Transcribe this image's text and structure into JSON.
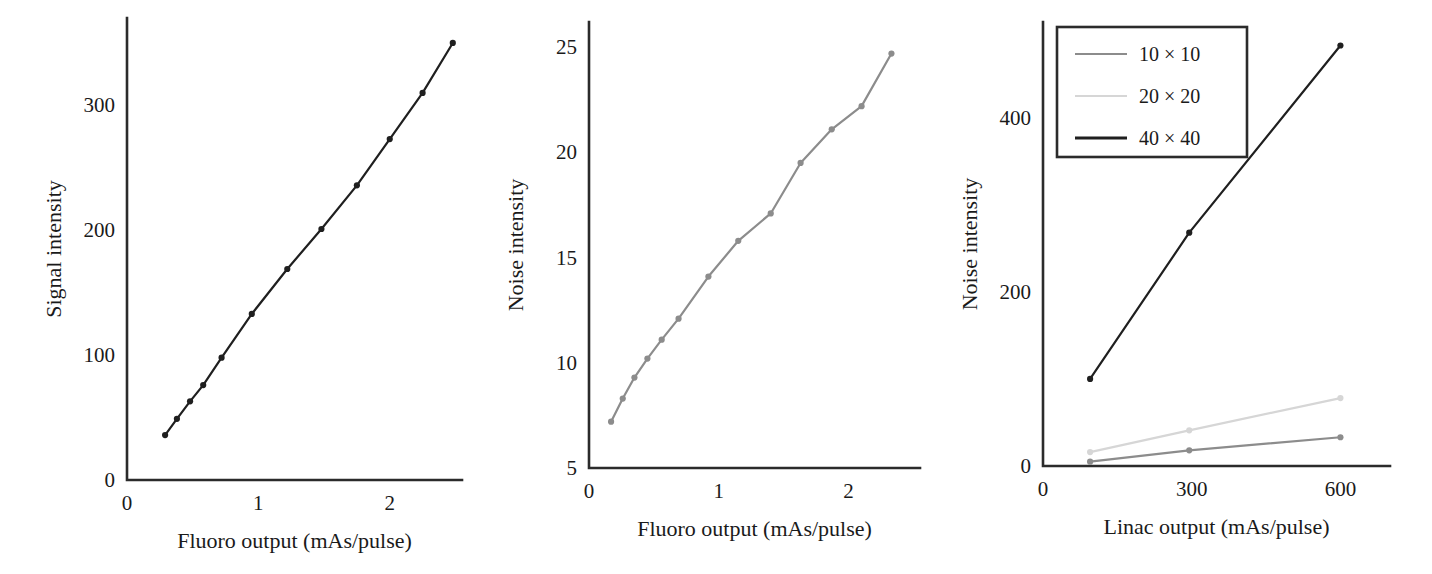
{
  "figure": {
    "background": "#ffffff",
    "axis_color": "#2b2b2b",
    "panel_count": 3
  },
  "colors": {
    "black": "#1f1f1f",
    "mid_gray": "#8c8c8c",
    "light_gray": "#d6d6d6",
    "axis": "#2b2b2b",
    "text": "#1a1a1a"
  },
  "chart_data": [
    {
      "id": "panel-a",
      "type": "line",
      "title": "",
      "xlabel": "Fluoro output (mAs/pulse)",
      "ylabel": "Signal intensity",
      "xlim": [
        0,
        2.55
      ],
      "ylim": [
        0,
        370
      ],
      "xticks": [
        0,
        1,
        2
      ],
      "xticklabels": [
        "0",
        "1",
        "2"
      ],
      "yticks": [
        0,
        100,
        200,
        300
      ],
      "yticklabels": [
        "0",
        "100",
        "200",
        "300"
      ],
      "grid": false,
      "legend": null,
      "series": [
        {
          "name": "signal",
          "color": "#1f1f1f",
          "marker": "circle",
          "x": [
            0.29,
            0.38,
            0.48,
            0.58,
            0.72,
            0.95,
            1.22,
            1.48,
            1.75,
            2.0,
            2.25,
            2.48
          ],
          "y": [
            36,
            49,
            63,
            76,
            98,
            133,
            169,
            201,
            236,
            273,
            310,
            350
          ]
        }
      ]
    },
    {
      "id": "panel-b",
      "type": "line",
      "title": "",
      "xlabel": "Fluoro output (mAs/pulse)",
      "ylabel": "Noise intensity",
      "xlim": [
        0,
        2.55
      ],
      "ylim": [
        5,
        26.2
      ],
      "xticks": [
        0,
        1,
        2
      ],
      "xticklabels": [
        "0",
        "1",
        "2"
      ],
      "yticks": [
        5,
        10,
        15,
        20,
        25
      ],
      "yticklabels": [
        "5",
        "10",
        "15",
        "20",
        "25"
      ],
      "grid": false,
      "legend": null,
      "series": [
        {
          "name": "noise",
          "color": "#8c8c8c",
          "marker": "circle",
          "x": [
            0.17,
            0.26,
            0.35,
            0.45,
            0.56,
            0.69,
            0.92,
            1.15,
            1.4,
            1.63,
            1.87,
            2.1,
            2.33
          ],
          "y": [
            7.2,
            8.3,
            9.3,
            10.2,
            11.1,
            12.1,
            14.1,
            15.8,
            17.1,
            19.5,
            21.1,
            22.2,
            24.7
          ]
        }
      ]
    },
    {
      "id": "panel-c",
      "type": "line",
      "title": "",
      "xlabel": "Linac output (mAs/pulse)",
      "ylabel": "Noise intensity",
      "xlim": [
        0,
        700
      ],
      "ylim": [
        0,
        510
      ],
      "xticks": [
        0,
        300,
        600
      ],
      "xticklabels": [
        "0",
        "300",
        "600"
      ],
      "yticks": [
        0,
        200,
        400
      ],
      "yticklabels": [
        "0",
        "200",
        "400"
      ],
      "grid": false,
      "legend": {
        "position": "top-left",
        "border": true,
        "entries": [
          "10 × 10",
          "20 × 20",
          "40 × 40"
        ]
      },
      "series": [
        {
          "name": "10 × 10",
          "color": "#8c8c8c",
          "marker": "circle",
          "x": [
            95,
            295,
            600
          ],
          "y": [
            5,
            18,
            33
          ]
        },
        {
          "name": "20 × 20",
          "color": "#d6d6d6",
          "marker": "circle",
          "x": [
            95,
            295,
            600
          ],
          "y": [
            16,
            41,
            78
          ]
        },
        {
          "name": "40 × 40",
          "color": "#1f1f1f",
          "marker": "circle",
          "x": [
            95,
            295,
            600
          ],
          "y": [
            100,
            268,
            483
          ]
        }
      ]
    }
  ]
}
